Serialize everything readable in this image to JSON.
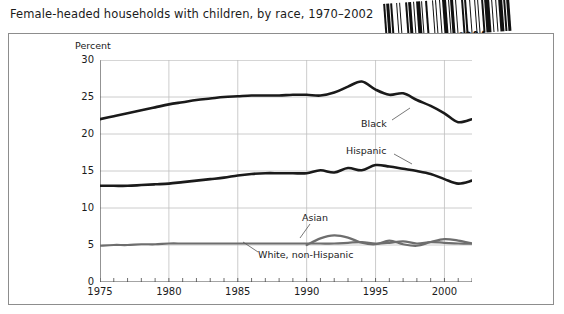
{
  "title": "Female-headed households with children, by race, 1970–2002",
  "barcode": {
    "number": "D0609804",
    "icon": "barcode-icon"
  },
  "chart_data": {
    "type": "line",
    "title": "Female-headed households with children, by race, 1970–2002",
    "xlabel": "",
    "ylabel": "Percent",
    "ylim": [
      0,
      30
    ],
    "xlim": [
      1975,
      2002
    ],
    "yticks": [
      0,
      5,
      10,
      15,
      20,
      25,
      30
    ],
    "xticks": [
      1975,
      1980,
      1985,
      1990,
      1995,
      2000
    ],
    "grid": true,
    "legend_position": "inline-annotations",
    "annotations": [
      {
        "label": "Black",
        "series": "Black"
      },
      {
        "label": "Hispanic",
        "series": "Hispanic"
      },
      {
        "label": "Asian",
        "series": "Asian"
      },
      {
        "label": "White, non-Hispanic",
        "series": "White, non-Hispanic"
      }
    ],
    "x": [
      1975,
      1976,
      1977,
      1978,
      1979,
      1980,
      1981,
      1982,
      1983,
      1984,
      1985,
      1986,
      1987,
      1988,
      1989,
      1990,
      1991,
      1992,
      1993,
      1994,
      1995,
      1996,
      1997,
      1998,
      1999,
      2000,
      2001,
      2002
    ],
    "series": [
      {
        "name": "Black",
        "color": "#1a1a1a",
        "values": [
          22.0,
          22.4,
          22.8,
          23.2,
          23.6,
          24.0,
          24.3,
          24.6,
          24.8,
          25.0,
          25.1,
          25.2,
          25.2,
          25.2,
          25.3,
          25.3,
          25.2,
          25.6,
          26.4,
          27.1,
          26.0,
          25.3,
          25.5,
          24.6,
          23.8,
          22.8,
          21.6,
          22.0
        ]
      },
      {
        "name": "Hispanic",
        "color": "#1a1a1a",
        "values": [
          13.0,
          13.0,
          13.0,
          13.1,
          13.2,
          13.3,
          13.5,
          13.7,
          13.9,
          14.1,
          14.4,
          14.6,
          14.7,
          14.7,
          14.7,
          14.7,
          15.1,
          14.8,
          15.4,
          15.1,
          15.8,
          15.6,
          15.3,
          15.0,
          14.6,
          13.9,
          13.3,
          13.7
        ]
      },
      {
        "name": "White, non-Hispanic",
        "color": "#6e6e6e",
        "values": [
          4.9,
          5.0,
          5.0,
          5.1,
          5.1,
          5.2,
          5.2,
          5.2,
          5.2,
          5.2,
          5.2,
          5.2,
          5.2,
          5.2,
          5.2,
          5.2,
          5.2,
          5.2,
          5.3,
          5.4,
          5.2,
          5.3,
          5.5,
          5.2,
          5.4,
          5.3,
          5.2,
          5.2
        ]
      },
      {
        "name": "Asian",
        "color": "#6e6e6e",
        "values": [
          null,
          null,
          null,
          null,
          null,
          null,
          null,
          null,
          null,
          null,
          null,
          null,
          null,
          null,
          null,
          5.0,
          5.9,
          6.3,
          6.0,
          5.3,
          5.1,
          5.6,
          5.1,
          4.9,
          5.4,
          5.8,
          5.6,
          5.2
        ]
      }
    ]
  }
}
